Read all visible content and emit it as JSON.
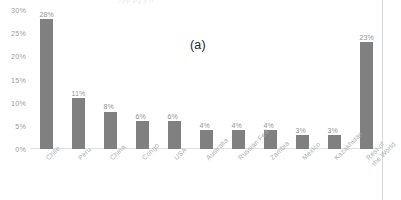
{
  "figure": {
    "panel_label": "(a)",
    "top_cropped_text_sliver": "ppp  pg  y  p",
    "bar_color": "#808080",
    "axis_text_color": "#9ba0a8",
    "label_text_color": "#a8adb5"
  },
  "chart_data": {
    "type": "bar",
    "title": "",
    "subtitle": "",
    "xlabel": "",
    "ylabel": "",
    "ylim": [
      0,
      30
    ],
    "ytick_labels": [
      "30%",
      "25%",
      "20%",
      "15%",
      "10%",
      "5%",
      "0%"
    ],
    "ytick_values": [
      30,
      25,
      20,
      15,
      10,
      5,
      0
    ],
    "grid": false,
    "legend": null,
    "annotations": [
      "(a)"
    ],
    "categories": [
      "Chile",
      "Peru",
      "China",
      "Congo",
      "USA",
      "Australia",
      "Russian Fed.",
      "Zambia",
      "Mexico",
      "Kazakhstan",
      "Rest of the World"
    ],
    "category_labels_display": [
      "Chile",
      "Peru",
      "China",
      "Congo",
      "USA",
      "Australia",
      "Russian Fed.",
      "Zambia",
      "Mexico",
      "Kazakhstan",
      "Rest of\nthe World"
    ],
    "values": [
      28,
      11,
      8,
      6,
      6,
      4,
      4,
      4,
      3,
      3,
      23
    ],
    "data_labels": [
      "28%",
      "11%",
      "8%",
      "6%",
      "6%",
      "4%",
      "4%",
      "4%",
      "3%",
      "3%",
      "23%"
    ]
  }
}
